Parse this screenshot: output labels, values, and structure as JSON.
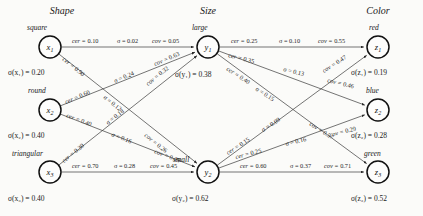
{
  "figure": {
    "background_color": "#fbfbf9",
    "node_stroke_color": "#111111",
    "edge_stroke_color": "#3a3a3a"
  },
  "groups": [
    {
      "id": "shape",
      "title": "Shape",
      "x": 62,
      "y": 14
    },
    {
      "id": "size",
      "title": "Size",
      "x": 208,
      "y": 14
    },
    {
      "id": "color",
      "title": "Color",
      "x": 378,
      "y": 14
    }
  ],
  "nodes": [
    {
      "id": "x1",
      "group": "shape",
      "value_name": "square",
      "label": "x",
      "sub": "1",
      "cx": 50,
      "cy": 47,
      "r": 11,
      "value_label_x": 27,
      "value_label_y": 30,
      "sigma_text": "σ(x₁) = 0.20",
      "sigma_value": 0.2,
      "sigma_x": 8,
      "sigma_y": 75
    },
    {
      "id": "x2",
      "group": "shape",
      "value_name": "round",
      "label": "x",
      "sub": "2",
      "cx": 50,
      "cy": 110,
      "r": 11,
      "value_label_x": 28,
      "value_label_y": 93,
      "sigma_text": "σ(x₂) = 0.40",
      "sigma_value": 0.4,
      "sigma_x": 8,
      "sigma_y": 138
    },
    {
      "id": "x3",
      "group": "shape",
      "value_name": "triangular",
      "label": "x",
      "sub": "3",
      "cx": 50,
      "cy": 172,
      "r": 11,
      "value_label_x": 12,
      "value_label_y": 156,
      "sigma_text": "σ(x₃) = 0.40",
      "sigma_value": 0.4,
      "sigma_x": 8,
      "sigma_y": 201
    },
    {
      "id": "y1",
      "group": "size",
      "value_name": "large",
      "label": "y",
      "sub": "1",
      "cx": 208,
      "cy": 47,
      "r": 11,
      "value_label_x": 192,
      "value_label_y": 30,
      "sigma_text": "σ(y₁) = 0.38",
      "sigma_value": 0.38,
      "sigma_x": 175,
      "sigma_y": 77
    },
    {
      "id": "y2",
      "group": "size",
      "value_name": "small",
      "label": "y",
      "sub": "2",
      "cx": 208,
      "cy": 172,
      "r": 11,
      "value_label_x": 173,
      "value_label_y": 162,
      "sigma_text": "σ(y₂) = 0.62",
      "sigma_value": 0.62,
      "sigma_x": 172,
      "sigma_y": 201
    },
    {
      "id": "z1",
      "group": "color",
      "value_name": "red",
      "label": "z",
      "sub": "1",
      "cx": 378,
      "cy": 47,
      "r": 11,
      "value_label_x": 369,
      "value_label_y": 30,
      "sigma_text": "σ(z₁) = 0.19",
      "sigma_value": 0.19,
      "sigma_x": 351,
      "sigma_y": 75
    },
    {
      "id": "z2",
      "group": "color",
      "value_name": "blue",
      "label": "z",
      "sub": "2",
      "cx": 378,
      "cy": 110,
      "r": 11,
      "value_label_x": 366,
      "value_label_y": 93,
      "sigma_text": "σ(z₂) = 0.28",
      "sigma_value": 0.28,
      "sigma_x": 351,
      "sigma_y": 138
    },
    {
      "id": "z3",
      "group": "color",
      "value_name": "green",
      "label": "z",
      "sub": "3",
      "cx": 378,
      "cy": 172,
      "r": 11,
      "value_label_x": 364,
      "value_label_y": 156,
      "sigma_text": "σ(z₃) = 0.52",
      "sigma_value": 0.52,
      "sigma_x": 351,
      "sigma_y": 201
    }
  ],
  "edges": [
    {
      "id": "x1-y1",
      "from": "x1",
      "to": "y1",
      "labels": [
        {
          "text": "cer = 0.10",
          "measure": "cer",
          "value": 0.1,
          "x": 72,
          "y": 43,
          "rot": 0
        },
        {
          "text": "σ = 0.02",
          "measure": "sigma",
          "value": 0.02,
          "x": 117,
          "y": 43,
          "rot": 0
        },
        {
          "text": "cov = 0.05",
          "measure": "cov",
          "value": 0.05,
          "x": 152,
          "y": 43,
          "rot": 0
        }
      ]
    },
    {
      "id": "x1-y2",
      "from": "x1",
      "to": "y2",
      "labels": [
        {
          "text": "cer = 0.90",
          "measure": "cer",
          "value": 0.9,
          "x": 62,
          "y": 60,
          "rot": 39
        },
        {
          "text": "σ = 0.12",
          "measure": "sigma",
          "value": 0.12,
          "x": 103,
          "y": 98,
          "rot": 39
        },
        {
          "text": "cov = 0.26",
          "measure": "cov",
          "value": 0.26,
          "x": 144,
          "y": 136,
          "rot": 39
        }
      ]
    },
    {
      "id": "x2-y1",
      "from": "x2",
      "to": "y1",
      "labels": [
        {
          "text": "cer = 0.60",
          "measure": "cer",
          "value": 0.6,
          "x": 66,
          "y": 104,
          "rot": -23
        },
        {
          "text": "σ = 0.24",
          "measure": "sigma",
          "value": 0.24,
          "x": 115,
          "y": 83,
          "rot": -23
        },
        {
          "text": "cov = 0.63",
          "measure": "cov",
          "value": 0.63,
          "x": 155,
          "y": 66,
          "rot": -23
        }
      ]
    },
    {
      "id": "x2-y2",
      "from": "x2",
      "to": "y2",
      "labels": [
        {
          "text": "cer = 0.40",
          "measure": "cer",
          "value": 0.4,
          "x": 66,
          "y": 117,
          "rot": 21
        },
        {
          "text": "σ = 0.16",
          "measure": "sigma",
          "value": 0.16,
          "x": 111,
          "y": 136,
          "rot": 21
        },
        {
          "text": "cov = 0.29",
          "measure": "cov",
          "value": 0.29,
          "x": 154,
          "y": 153,
          "rot": 21
        }
      ]
    },
    {
      "id": "x3-y1",
      "from": "x3",
      "to": "y1",
      "labels": [
        {
          "text": "cer = 0.30",
          "measure": "cer",
          "value": 0.3,
          "x": 64,
          "y": 163,
          "rot": -39
        },
        {
          "text": "σ = 0.18",
          "measure": "sigma",
          "value": 0.18,
          "x": 108,
          "y": 125,
          "rot": -39
        },
        {
          "text": "cov = 0.32",
          "measure": "cov",
          "value": 0.32,
          "x": 148,
          "y": 86,
          "rot": -39
        }
      ]
    },
    {
      "id": "x3-y2",
      "from": "x3",
      "to": "y2",
      "labels": [
        {
          "text": "cer = 0.70",
          "measure": "cer",
          "value": 0.7,
          "x": 72,
          "y": 168,
          "rot": 0
        },
        {
          "text": "σ = 0.28",
          "measure": "sigma",
          "value": 0.28,
          "x": 114,
          "y": 168,
          "rot": 0
        },
        {
          "text": "cov = 0.45",
          "measure": "cov",
          "value": 0.45,
          "x": 150,
          "y": 168,
          "rot": 0
        }
      ]
    },
    {
      "id": "y1-z1",
      "from": "y1",
      "to": "z1",
      "labels": [
        {
          "text": "cer = 0.25",
          "measure": "cer",
          "value": 0.25,
          "x": 231,
          "y": 43,
          "rot": 0
        },
        {
          "text": "σ = 0.10",
          "measure": "sigma",
          "value": 0.1,
          "x": 279,
          "y": 43,
          "rot": 0
        },
        {
          "text": "cov = 0.55",
          "measure": "cov",
          "value": 0.55,
          "x": 318,
          "y": 43,
          "rot": 0
        }
      ]
    },
    {
      "id": "y1-z2",
      "from": "y1",
      "to": "z2",
      "labels": [
        {
          "text": "cer = 0.35",
          "measure": "cer",
          "value": 0.35,
          "x": 228,
          "y": 57,
          "rot": 14
        },
        {
          "text": "σ = 0.13",
          "measure": "sigma",
          "value": 0.13,
          "x": 283,
          "y": 71,
          "rot": 14
        },
        {
          "text": "cov = 0.46",
          "measure": "cov",
          "value": 0.46,
          "x": 327,
          "y": 82,
          "rot": 14
        }
      ]
    },
    {
      "id": "y1-z3",
      "from": "y1",
      "to": "z3",
      "labels": [
        {
          "text": "cer = 0.40",
          "measure": "cer",
          "value": 0.4,
          "x": 226,
          "y": 70,
          "rot": 33
        },
        {
          "text": "σ = 0.15",
          "measure": "sigma",
          "value": 0.15,
          "x": 255,
          "y": 90,
          "rot": 33
        },
        {
          "text": "cov = 0.57",
          "measure": "cov",
          "value": 0.57,
          "x": 309,
          "y": 125,
          "rot": 33
        }
      ]
    },
    {
      "id": "y2-z1",
      "from": "y2",
      "to": "z1",
      "labels": [
        {
          "text": "cer = 0.15",
          "measure": "cer",
          "value": 0.15,
          "x": 228,
          "y": 155,
          "rot": -33
        },
        {
          "text": "σ = 0.09",
          "measure": "sigma",
          "value": 0.09,
          "x": 263,
          "y": 132,
          "rot": -33
        },
        {
          "text": "cov = 0.47",
          "measure": "cov",
          "value": 0.47,
          "x": 324,
          "y": 73,
          "rot": -33
        }
      ]
    },
    {
      "id": "y2-z2",
      "from": "y2",
      "to": "z2",
      "labels": [
        {
          "text": "cer = 0.25",
          "measure": "cer",
          "value": 0.25,
          "x": 236,
          "y": 159,
          "rot": -14
        },
        {
          "text": "σ = 0.16",
          "measure": "sigma",
          "value": 0.16,
          "x": 286,
          "y": 146,
          "rot": -14
        },
        {
          "text": "cov = 0.29",
          "measure": "cov",
          "value": 0.29,
          "x": 330,
          "y": 137,
          "rot": -14
        }
      ]
    },
    {
      "id": "y2-z3",
      "from": "y2",
      "to": "z3",
      "labels": [
        {
          "text": "cer = 0.60",
          "measure": "cer",
          "value": 0.6,
          "x": 240,
          "y": 168,
          "rot": 0
        },
        {
          "text": "σ = 0.37",
          "measure": "sigma",
          "value": 0.37,
          "x": 290,
          "y": 168,
          "rot": 0
        },
        {
          "text": "cov = 0.71",
          "measure": "cov",
          "value": 0.71,
          "x": 324,
          "y": 168,
          "rot": 0
        }
      ]
    }
  ]
}
